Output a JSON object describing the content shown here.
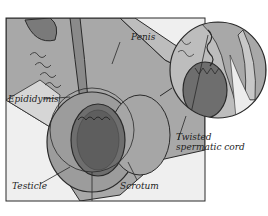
{
  "figure": {
    "colors": {
      "background": "#ffffff",
      "tissue_light": "#b8b8b8",
      "tissue_mid": "#9a9a9a",
      "tissue_dark": "#6e6e6e",
      "outline": "#2a2a2a",
      "inset_bg": "#efefef"
    },
    "labels": {
      "penis": "Penis",
      "epididymis": "Epididymis",
      "testicle": "Testicle",
      "scrotum": "Scrotum",
      "twisted_cord_line1": "Twisted",
      "twisted_cord_line2": "spermatic cord"
    }
  }
}
